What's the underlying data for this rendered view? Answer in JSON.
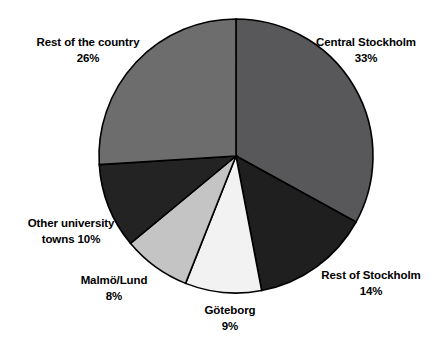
{
  "chart_data": {
    "type": "pie",
    "title": "",
    "subtitle": "",
    "xlabel": "",
    "ylabel": "",
    "legend_position": "none",
    "grid": false,
    "label_format": "name + percent",
    "start_angle_deg": 0,
    "direction": "clockwise",
    "unit": "%",
    "total": 100,
    "categories": [
      "Central Stockholm",
      "Rest of Stockholm",
      "Göteborg",
      "Malmö/Lund",
      "Other university towns",
      "Rest of the country"
    ],
    "values": [
      33,
      14,
      9,
      8,
      10,
      26
    ],
    "colors": [
      "#58585a",
      "#1f1f1f",
      "#f2f2f2",
      "#c4c4c4",
      "#232323",
      "#6d6d6d"
    ],
    "slices": [
      {
        "name": "Central Stockholm",
        "value": 33,
        "value_label": "33%",
        "label_line1": "Central Stockholm",
        "label_line2": "33%",
        "color": "#58585a",
        "start_deg": 0,
        "end_deg": 118.8
      },
      {
        "name": "Rest of Stockholm",
        "value": 14,
        "value_label": "14%",
        "label_line1": "Rest of Stockholm",
        "label_line2": "14%",
        "color": "#1f1f1f",
        "start_deg": 118.8,
        "end_deg": 169.2
      },
      {
        "name": "Göteborg",
        "value": 9,
        "value_label": "9%",
        "label_line1": "Göteborg",
        "label_line2": "9%",
        "color": "#f2f2f2",
        "start_deg": 169.2,
        "end_deg": 201.6
      },
      {
        "name": "Malmö/Lund",
        "value": 8,
        "value_label": "8%",
        "label_line1": "Malmö/Lund",
        "label_line2": "8%",
        "color": "#c4c4c4",
        "start_deg": 201.6,
        "end_deg": 230.4
      },
      {
        "name": "Other university towns",
        "value": 10,
        "value_label": "10%",
        "label_line1": "Other university",
        "label_line2": "towns 10%",
        "color": "#232323",
        "start_deg": 230.4,
        "end_deg": 266.4
      },
      {
        "name": "Rest of the country",
        "value": 26,
        "value_label": "26%",
        "label_line1": "Rest of the country",
        "label_line2": "26%",
        "color": "#6d6d6d",
        "start_deg": 266.4,
        "end_deg": 360
      }
    ]
  },
  "labels": {
    "central_stockholm": "Central Stockholm\n33%",
    "rest_of_stockholm": "Rest of Stockholm\n14%",
    "goteborg": "Göteborg\n9%",
    "malmo_lund": "Malmö/Lund\n8%",
    "other_university_towns": "Other university\ntowns 10%",
    "rest_of_country": "Rest of the country\n26%"
  },
  "style": {
    "outline_color": "#000000",
    "background": "#ffffff",
    "center_x": 236,
    "center_y": 156,
    "radius": 137
  }
}
